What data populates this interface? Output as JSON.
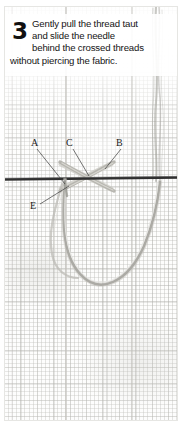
{
  "page": {
    "domain_kind": "instructional-photo",
    "width": 182,
    "height": 425,
    "background_color": "#ffffff"
  },
  "caption": {
    "step_number": "3",
    "lines": [
      "Gently pull the thread taut",
      "and slide the needle",
      "behind the crossed threads",
      "without piercing the fabric."
    ],
    "full_text": "Gently pull the thread taut and slide the needle behind the crossed threads without piercing the fabric.",
    "text_color": "#141414",
    "plate_color": "#ffffff"
  },
  "diagram": {
    "fabric": {
      "name": "aida-cloth",
      "weave_color": "#abaaa6",
      "base_color": "#fdfdfc"
    },
    "labels": [
      {
        "id": "A",
        "text": "A",
        "x": 30,
        "y": 137,
        "target_x": 61,
        "target_y": 178,
        "meaning": "left leg of cross where needle enters"
      },
      {
        "id": "C",
        "text": "C",
        "x": 65,
        "y": 137,
        "target_x": 84,
        "target_y": 172,
        "meaning": "centre of the crossed threads"
      },
      {
        "id": "B",
        "text": "B",
        "x": 115,
        "y": 137,
        "target_x": 100,
        "target_y": 165,
        "meaning": "right leg of cross"
      },
      {
        "id": "E",
        "text": "E",
        "x": 29,
        "y": 200,
        "target_x": 64,
        "target_y": 182,
        "meaning": "working thread emerging below"
      }
    ],
    "threads": {
      "horizontal_thread_color": "#2b2b2b",
      "horizontal_thread_y": 172,
      "crossed_thread_color": "#b9b8b2",
      "needle_color": "#b5b4ae",
      "thread_bundle_color": "#9b9a94",
      "thread_bundle_x": 153
    }
  }
}
